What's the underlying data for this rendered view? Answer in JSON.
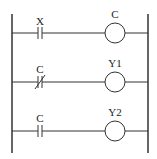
{
  "diagram": {
    "type": "ladder-logic",
    "rails": {
      "left_x": 12,
      "right_x": 148,
      "top_y": 14,
      "bottom_y": 153
    },
    "rungs": [
      {
        "y": 33,
        "contact": {
          "label": "X",
          "type": "normally-open"
        },
        "coil": {
          "label": "C"
        }
      },
      {
        "y": 82,
        "contact": {
          "label": "C",
          "type": "normally-closed"
        },
        "coil": {
          "label": "Y1"
        }
      },
      {
        "y": 131,
        "contact": {
          "label": "C",
          "type": "normally-open"
        },
        "coil": {
          "label": "Y2"
        }
      }
    ],
    "line_color": "#333333"
  }
}
